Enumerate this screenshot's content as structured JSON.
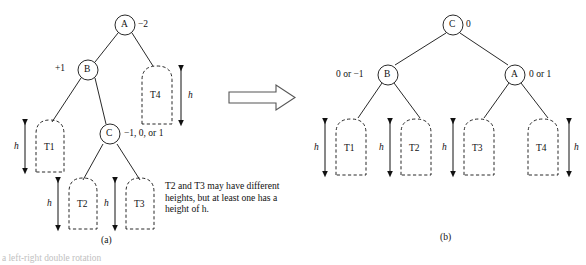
{
  "figure": {
    "transform_arrow": "rightwards-block-arrow",
    "panels": [
      {
        "id": "a",
        "label": "(a)",
        "nodes": [
          {
            "id": "A",
            "letter": "A",
            "balance": "−2"
          },
          {
            "id": "B",
            "letter": "B",
            "balance": "+1"
          },
          {
            "id": "C",
            "letter": "C",
            "balance": "−1, 0, or 1"
          }
        ],
        "subtrees": [
          {
            "id": "T1",
            "name": "T1",
            "height_label": "h"
          },
          {
            "id": "T2",
            "name": "T2",
            "height_label": "h"
          },
          {
            "id": "T3",
            "name": "T3",
            "height_label": "h"
          },
          {
            "id": "T4",
            "name": "T4",
            "height_label": "h"
          }
        ],
        "note": "T2 and T3 may have different heights, but at least one has a height of h."
      },
      {
        "id": "b",
        "label": "(b)",
        "nodes": [
          {
            "id": "C",
            "letter": "C",
            "balance": "0"
          },
          {
            "id": "B",
            "letter": "B",
            "balance": "0 or −1"
          },
          {
            "id": "A",
            "letter": "A",
            "balance": "0 or 1"
          }
        ],
        "subtrees": [
          {
            "id": "T1",
            "name": "T1",
            "height_label": "h"
          },
          {
            "id": "T2",
            "name": "T2",
            "height_label": "h"
          },
          {
            "id": "T3",
            "name": "T3",
            "height_label": "h"
          },
          {
            "id": "T4",
            "name": "T4",
            "height_label": "h"
          }
        ]
      }
    ],
    "footer_caption": "a left-right double rotation",
    "colors": {
      "ink": "#111111",
      "background": "#ffffff",
      "arrow_outline": "#555555"
    }
  }
}
